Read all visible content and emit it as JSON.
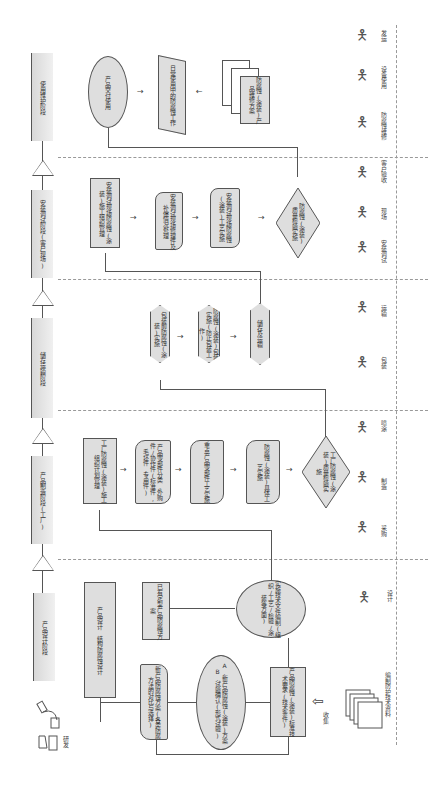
{
  "stages": [
    {
      "id": "use",
      "label": "使用维护阶段"
    },
    {
      "id": "install",
      "label": "安装调试阶段(客户现场)"
    },
    {
      "id": "storage",
      "label": "储存运输阶段"
    },
    {
      "id": "manufacture",
      "label": "产品制造阶段(工厂)"
    },
    {
      "id": "design",
      "label": "产品设计阶段"
    }
  ],
  "use_stage": {
    "delivery": "产品交付使用",
    "daily": "日常使用中的防腐蚀工作",
    "plan": "防腐蚀(涂装)产品维修方案"
  },
  "install_stage": {
    "plan": "安装调试现场防腐蚀(涂装)施工组织管理",
    "repair": "安装调试现场修理件及补偿情况处理",
    "process": "安装调试现场防腐蚀(涂装)工艺实施",
    "check": "防腐蚀(涂装)质量检验实施"
  },
  "storage_stage": {
    "pack": "包装前防腐蚀(涂装)实施",
    "transport": "防腐蚀(涂装)包装实施(防止包装工作)",
    "store": "储存及运输"
  },
  "manufacture_stage": {
    "plan": "工厂防腐蚀(涂装)施工组织计划管理",
    "parts": "产品零部件分类,外购件/协作件(标准件,毛坯件,专用件)",
    "process": "重点产品零部件工艺实施",
    "detail": "防腐蚀(涂装)具体工艺实施",
    "check": "工厂防腐蚀(涂装)质量检验实施"
  },
  "design_stage": {
    "design": "产品设计  结构防腐蚀设计",
    "existing": "已有定型产品防腐蚀方案",
    "tech_doc": "实施技术文件编制(组织/工艺/检验/涂装等方面)",
    "new_plan": "新产品防腐蚀方案(各类防腐方法的对比与选择)",
    "eval": "A.新产品防腐蚀(涂装)方案 B.试验确认(形式试验)",
    "standard": "产品防腐蚀(涂装)标准技术要求(技术条件)"
  },
  "roles": [
    {
      "label": "发运"
    },
    {
      "label": "设备使用"
    },
    {
      "label": "防腐蚀维修"
    },
    {
      "label": "客户验收"
    },
    {
      "label": "现场"
    },
    {
      "label": "安装调试"
    },
    {
      "label": "运输"
    },
    {
      "label": "包装"
    },
    {
      "label": "喷涂"
    },
    {
      "label": "制造"
    },
    {
      "label": "采购"
    },
    {
      "label": "设计"
    }
  ],
  "materials": {
    "docs": "编制防护技术资料",
    "collect": "收集"
  },
  "research": "研发"
}
